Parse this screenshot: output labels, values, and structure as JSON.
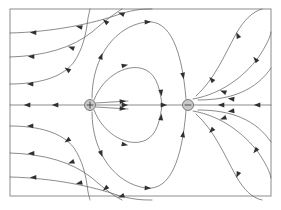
{
  "figure": {
    "background_color": "#ffffff",
    "frame": {
      "x": 10,
      "y": 9,
      "width": 261,
      "height": 187,
      "stroke_color": "#8c8c8c",
      "stroke_width": 1
    },
    "line_color": "#5a5a5a",
    "arrow_color": "#303030"
  },
  "chart_data": {
    "type": "line",
    "xlabel": "",
    "ylabel": "",
    "grid": false,
    "legend": "none",
    "xlim": [
      10,
      271
    ],
    "ylim": [
      9,
      196
    ],
    "charges": [
      {
        "name": "positive-charge",
        "sign": "+",
        "label": "+",
        "x": 90,
        "y": 105,
        "radius": 5.5,
        "fill_color": "#c9c9c9",
        "stroke_color": "#4a4a4a"
      },
      {
        "name": "negative-charge",
        "sign": "-",
        "label": "−",
        "x": 188,
        "y": 105,
        "radius": 5.5,
        "fill_color": "#c9c9c9",
        "stroke_color": "#4a4a4a"
      }
    ],
    "series": [
      {
        "name": "axis-line-left",
        "path": "M 10,105 L 84,105",
        "arrows": [
          {
            "x": 28,
            "y": 105,
            "angle": 180
          },
          {
            "x": 56,
            "y": 105,
            "angle": 180
          }
        ]
      },
      {
        "name": "axis-line-right",
        "path": "M 194,105 L 271,105",
        "arrows": [
          {
            "x": 222,
            "y": 105,
            "angle": 180
          },
          {
            "x": 258,
            "y": 105,
            "angle": 180
          }
        ]
      },
      {
        "name": "inner-axis-upper",
        "path": "M 96,103 L 128,101",
        "arrows": [
          {
            "x": 122,
            "y": 101.4,
            "angle": 356
          }
        ]
      },
      {
        "name": "inner-axis-mid",
        "path": "M 96,105 L 184,105",
        "arrows": [
          {
            "x": 124,
            "y": 105,
            "angle": 0
          },
          {
            "x": 163,
            "y": 105,
            "angle": 0
          }
        ]
      },
      {
        "name": "inner-axis-lower",
        "path": "M 96,107 L 128,109",
        "arrows": [
          {
            "x": 122,
            "y": 108.6,
            "angle": 4
          }
        ]
      },
      {
        "name": "loop-upper-inner",
        "path": "M 94,100 C 104,74 130,62 146,70 C 158,76 160,92 162,104",
        "arrows": [
          {
            "x": 124,
            "y": 65.5,
            "angle": 348
          },
          {
            "x": 161,
            "y": 92,
            "angle": 83
          }
        ]
      },
      {
        "name": "loop-lower-inner",
        "path": "M 94,110 C 104,136 130,148 146,140 C 158,134 160,118 162,106",
        "arrows": [
          {
            "x": 124,
            "y": 144.5,
            "angle": 12
          },
          {
            "x": 161,
            "y": 118,
            "angle": 277
          }
        ]
      },
      {
        "name": "loop-upper-outer",
        "path": "M 92,98 C 92,56 116,26 146,22 C 170,19 182,50 186,99",
        "arrows": [
          {
            "x": 101,
            "y": 57,
            "angle": 290
          },
          {
            "x": 147,
            "y": 22,
            "angle": 357
          },
          {
            "x": 183,
            "y": 75,
            "angle": 80
          }
        ]
      },
      {
        "name": "loop-lower-outer",
        "path": "M 92,112 C 92,154 116,184 146,188 C 170,191 182,160 186,111",
        "arrows": [
          {
            "x": 101,
            "y": 153,
            "angle": 70
          },
          {
            "x": 147,
            "y": 188,
            "angle": 3
          },
          {
            "x": 183,
            "y": 135,
            "angle": 280
          }
        ]
      },
      {
        "name": "outer-arc-upper-1",
        "path": "M 10,84 C 38,84 62,78 74,62 C 82,50 86,36 88,18 C 90,9 90,9 90,9",
        "arrows": [
          {
            "x": 31,
            "y": 84,
            "angle": 181
          },
          {
            "x": 68,
            "y": 70,
            "angle": 215
          }
        ]
      },
      {
        "name": "outer-arc-lower-1",
        "path": "M 10,126 C 38,126 62,132 74,148 C 82,160 86,174 88,192 C 90,200 90,200 90,200",
        "arrows": [
          {
            "x": 31,
            "y": 126,
            "angle": 179
          },
          {
            "x": 68,
            "y": 140,
            "angle": 145
          }
        ]
      },
      {
        "name": "outer-arc-upper-2",
        "path": "M 10,57 C 44,56 72,48 92,32 C 106,20 114,14 122,9",
        "arrows": [
          {
            "x": 32,
            "y": 56.5,
            "angle": 181
          },
          {
            "x": 72,
            "y": 48,
            "angle": 200
          },
          {
            "x": 106,
            "y": 22,
            "angle": 220
          }
        ]
      },
      {
        "name": "outer-arc-lower-2",
        "path": "M 10,153 C 44,154 72,162 92,178 C 106,190 114,196 122,200",
        "arrows": [
          {
            "x": 32,
            "y": 153.5,
            "angle": 179
          },
          {
            "x": 72,
            "y": 162,
            "angle": 160
          },
          {
            "x": 106,
            "y": 188,
            "angle": 140
          }
        ]
      },
      {
        "name": "outer-arc-upper-3",
        "path": "M 10,33 C 52,32 92,24 120,14 C 136,9 144,9 152,9",
        "arrows": [
          {
            "x": 34,
            "y": 32.5,
            "angle": 181
          },
          {
            "x": 80,
            "y": 27,
            "angle": 192
          },
          {
            "x": 122,
            "y": 14,
            "angle": 200
          }
        ]
      },
      {
        "name": "outer-arc-lower-3",
        "path": "M 10,177 C 52,178 92,186 120,196 C 136,200 144,200 152,200",
        "arrows": [
          {
            "x": 34,
            "y": 177.5,
            "angle": 179
          },
          {
            "x": 80,
            "y": 183,
            "angle": 168
          },
          {
            "x": 122,
            "y": 196,
            "angle": 160
          }
        ]
      },
      {
        "name": "right-arc-upper-1",
        "path": "M 196,96 C 214,80 224,56 236,34 C 244,20 252,12 262,9",
        "arrows": [
          {
            "x": 212,
            "y": 80,
            "angle": 228
          },
          {
            "x": 238,
            "y": 36,
            "angle": 245
          }
        ]
      },
      {
        "name": "right-arc-lower-1",
        "path": "M 196,114 C 214,130 224,154 236,176 C 244,190 252,198 262,200",
        "arrows": [
          {
            "x": 212,
            "y": 130,
            "angle": 132
          },
          {
            "x": 238,
            "y": 174,
            "angle": 115
          }
        ]
      },
      {
        "name": "right-arc-upper-2",
        "path": "M 193,99 C 222,94 244,76 258,58 C 266,46 270,38 271,32",
        "arrows": [
          {
            "x": 224,
            "y": 92,
            "angle": 200
          },
          {
            "x": 256,
            "y": 60,
            "angle": 230
          }
        ]
      },
      {
        "name": "right-arc-lower-2",
        "path": "M 193,111 C 222,116 244,134 258,152 C 266,164 270,172 271,178",
        "arrows": [
          {
            "x": 224,
            "y": 118,
            "angle": 160
          },
          {
            "x": 256,
            "y": 150,
            "angle": 130
          }
        ]
      },
      {
        "name": "far-right-arc-upper",
        "path": "M 198,100 C 232,100 256,90 271,68",
        "arrows": [
          {
            "x": 232,
            "y": 99,
            "angle": 186
          }
        ]
      },
      {
        "name": "far-right-arc-lower",
        "path": "M 198,110 C 232,110 256,120 271,142",
        "arrows": [
          {
            "x": 232,
            "y": 111,
            "angle": 174
          }
        ]
      }
    ]
  }
}
